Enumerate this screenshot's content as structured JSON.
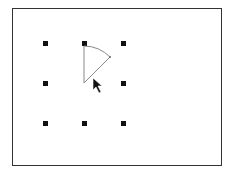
{
  "canvas": {
    "border_color": "#333333",
    "background": "#ffffff"
  },
  "grid_dots": [
    {
      "row": 0,
      "col": 0
    },
    {
      "row": 0,
      "col": 1
    },
    {
      "row": 0,
      "col": 2
    },
    {
      "row": 1,
      "col": 0
    },
    {
      "row": 1,
      "col": 1
    },
    {
      "row": 1,
      "col": 2
    },
    {
      "row": 2,
      "col": 0
    },
    {
      "row": 2,
      "col": 1
    },
    {
      "row": 2,
      "col": 2
    }
  ],
  "sector": {
    "center": "middle-center dot",
    "from": "top-center dot",
    "angle_deg": 45,
    "stroke_color": "#888888"
  },
  "cursor": {
    "icon": "mouse-pointer-icon"
  }
}
